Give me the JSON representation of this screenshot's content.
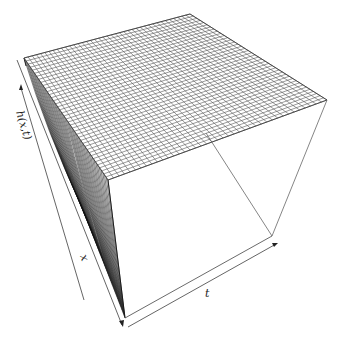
{
  "chart_data": {
    "type": "surface3d",
    "title": "",
    "axes": {
      "x": {
        "label": "x",
        "ticks": []
      },
      "t": {
        "label": "t",
        "ticks": []
      },
      "z": {
        "label": "h(x,t)",
        "ticks": []
      }
    },
    "grid": {
      "rows": 40,
      "cols": 40
    },
    "surface": "h(x,t) ≈ constant (maximum) for t > 0; rises sharply from 0 near t = 0",
    "box": true,
    "legend": null
  },
  "labels": {
    "z_axis": "h(x,t)",
    "x_axis": "x",
    "t_axis": "t"
  },
  "colors": {
    "mesh_line": "#555555",
    "wall_line": "#111111",
    "background": "#ffffff"
  }
}
